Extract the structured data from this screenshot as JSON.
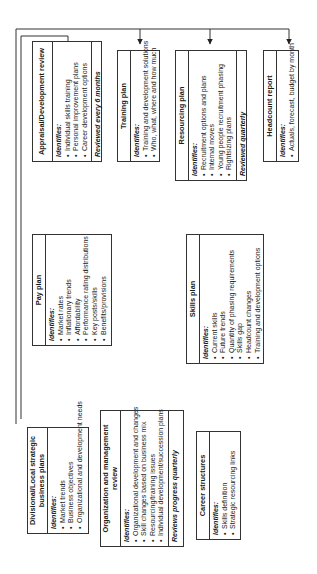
{
  "diagram": {
    "orientation": "rotated-90-ccw",
    "identifies_label": "Identifies:",
    "boxes": {
      "divisional": {
        "title": "Divisional/Local strategic business plans",
        "items": [
          "Market trends",
          "Business objectives",
          "Organizational and development needs"
        ]
      },
      "org_review": {
        "title": "Organization and management review",
        "items": [
          "Organizational development and changes",
          "Skill changes based on business mix",
          "Resourcing/training issues",
          "Individual development/succession plans"
        ],
        "footer": "Reviews progress quarterly"
      },
      "career": {
        "title": "Career structures",
        "items": [
          "Skills definition",
          "Strategic resourcing links"
        ]
      },
      "pay": {
        "title": "Pay plan",
        "items": [
          "Market rates",
          "Inflationary trends",
          "Affordability",
          "Performance rating distributions",
          "Key posts/skills",
          "Benefits/provisions"
        ]
      },
      "skills": {
        "title": "Skills plan",
        "items": [
          "Current skills",
          "Future trends",
          "Quantity of phasing requirements",
          "Skills gap",
          "Headcount changes",
          "Training and development options"
        ]
      },
      "appraisal": {
        "title": "Appraisal/Development review",
        "items": [
          "Individual skills training",
          "Personal improvement plans",
          "Career development options"
        ],
        "footer": "Reviewed every 6 months"
      },
      "training": {
        "title": "Training plan",
        "items": [
          "Training and development solutions",
          "Who, what, where and how much"
        ]
      },
      "resourcing": {
        "title": "Resourcing plan",
        "items": [
          "Recruitment options and plans",
          "Internal moves",
          "Young people recruitment phasing",
          "Rightsizing plans"
        ],
        "footer": "Reviewed quarterly"
      },
      "headcount": {
        "title": "Headcount report",
        "items": [
          "Actuals, forecast, budget by month"
        ]
      }
    },
    "connections": [
      {
        "from": "divisional",
        "to": "pay"
      },
      {
        "from": "divisional",
        "to": "org_review"
      },
      {
        "from": "org_review",
        "to": "skills"
      },
      {
        "from": "career",
        "to": "skills"
      },
      {
        "from": "skills",
        "to": "appraisal"
      },
      {
        "from": "skills",
        "to": "training"
      },
      {
        "from": "skills",
        "to": "resourcing"
      },
      {
        "from": "skills",
        "to": "headcount"
      },
      {
        "from": "divisional",
        "to": "training"
      },
      {
        "from": "divisional",
        "to": "resourcing"
      },
      {
        "from": "divisional",
        "to": "headcount"
      }
    ],
    "colors": {
      "line": "#333333",
      "background": "#ffffff",
      "text": "#1a1a1a"
    }
  }
}
